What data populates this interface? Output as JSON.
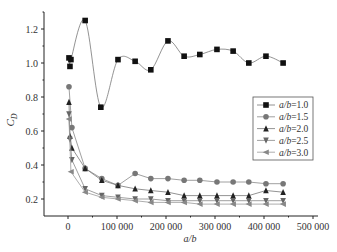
{
  "chart_data": {
    "type": "line",
    "title": "",
    "xlabel": "a/b",
    "ylabel": "C_D",
    "xlim": [
      -50000,
      500000
    ],
    "ylim": [
      0.1,
      1.3
    ],
    "xticks": [
      0,
      100000,
      200000,
      300000,
      400000,
      500000
    ],
    "xtick_labels": [
      "0",
      "100 000",
      "200 000",
      "300 000",
      "400 000",
      "500 000"
    ],
    "yticks": [
      0.2,
      0.4,
      0.6,
      0.8,
      1.0,
      1.2
    ],
    "ytick_labels": [
      "0.2",
      "0.4",
      "0.6",
      "0.8",
      "1.0",
      "1.2"
    ],
    "grid": false,
    "legend_position": "right-middle",
    "series": [
      {
        "name": "a/b=1.0",
        "marker": "square",
        "color": "#111111",
        "line_color": "#777777",
        "smooth": true,
        "x": [
          2000,
          6000,
          4000,
          35000,
          67000,
          102000,
          137000,
          169000,
          204000,
          237000,
          269000,
          304000,
          337000,
          369000,
          404000,
          439000
        ],
        "y": [
          1.03,
          1.02,
          0.98,
          1.25,
          0.74,
          1.02,
          1.01,
          0.96,
          1.13,
          1.04,
          1.05,
          1.08,
          1.07,
          1.0,
          1.04,
          1.0
        ]
      },
      {
        "name": "a/b=1.5",
        "marker": "circle",
        "color": "#777777",
        "line_color": "#888888",
        "smooth": false,
        "x": [
          2000,
          8000,
          35000,
          69000,
          102000,
          137000,
          169000,
          204000,
          237000,
          269000,
          304000,
          337000,
          369000,
          404000,
          439000
        ],
        "y": [
          0.86,
          0.62,
          0.38,
          0.32,
          0.28,
          0.35,
          0.32,
          0.32,
          0.31,
          0.31,
          0.3,
          0.3,
          0.3,
          0.29,
          0.29
        ]
      },
      {
        "name": "a/b=2.0",
        "marker": "triangle-up",
        "color": "#222222",
        "line_color": "#777777",
        "smooth": false,
        "x": [
          2000,
          4000,
          8000,
          35000,
          69000,
          102000,
          137000,
          169000,
          204000,
          237000,
          269000,
          304000,
          337000,
          369000,
          404000,
          439000
        ],
        "y": [
          0.77,
          0.57,
          0.5,
          0.38,
          0.31,
          0.28,
          0.26,
          0.25,
          0.24,
          0.22,
          0.22,
          0.22,
          0.22,
          0.22,
          0.25,
          0.24
        ]
      },
      {
        "name": "a/b=2.5",
        "marker": "triangle-down",
        "color": "#666666",
        "line_color": "#888888",
        "smooth": false,
        "x": [
          2000,
          4000,
          8000,
          35000,
          69000,
          102000,
          137000,
          169000,
          204000,
          237000,
          269000,
          304000,
          337000,
          369000,
          404000,
          439000
        ],
        "y": [
          0.7,
          0.55,
          0.43,
          0.26,
          0.22,
          0.21,
          0.2,
          0.2,
          0.19,
          0.19,
          0.19,
          0.19,
          0.19,
          0.19,
          0.19,
          0.19
        ]
      },
      {
        "name": "a/b=3.0",
        "marker": "triangle-left",
        "color": "#888888",
        "line_color": "#999999",
        "smooth": false,
        "x": [
          2000,
          6000,
          35000,
          69000,
          102000,
          137000,
          169000,
          204000,
          237000,
          269000,
          304000,
          337000,
          369000,
          404000,
          439000
        ],
        "y": [
          0.67,
          0.36,
          0.24,
          0.21,
          0.2,
          0.19,
          0.18,
          0.18,
          0.18,
          0.17,
          0.17,
          0.17,
          0.17,
          0.17,
          0.17
        ]
      }
    ]
  }
}
